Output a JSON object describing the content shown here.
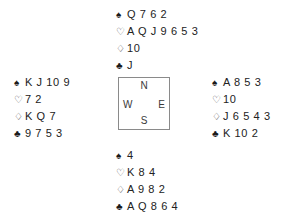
{
  "diagram": {
    "type": "bridge-deal",
    "suit_symbols": {
      "spades": "♠",
      "hearts": "♡",
      "diamonds": "♢",
      "clubs": "♣"
    },
    "compass": {
      "north": "N",
      "south": "S",
      "west": "W",
      "east": "E"
    },
    "hands": {
      "north": {
        "label": "North",
        "spades": "Q 7 6 2",
        "hearts": "A Q J 9 6 5 3",
        "diamonds": "10",
        "clubs": "J"
      },
      "west": {
        "label": "West",
        "spades": "K J 10 9",
        "hearts": "7 2",
        "diamonds": "K Q 7",
        "clubs": "9 7 5 3"
      },
      "east": {
        "label": "East",
        "spades": "A 8 5 3",
        "hearts": "10",
        "diamonds": "J 6 5 4 3",
        "clubs": "K 10 2"
      },
      "south": {
        "label": "South",
        "spades": "4",
        "hearts": "K 8 4",
        "diamonds": "A 9 8 2",
        "clubs": "A Q 8 6 4"
      }
    }
  }
}
